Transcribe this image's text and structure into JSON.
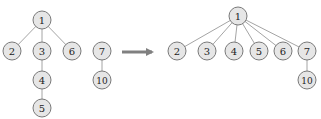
{
  "diagram": {
    "title": "",
    "colors": {
      "node_fill": "#e6e6e6",
      "node_stroke": "#7a7a7a",
      "edge": "#9a9a9a",
      "arrow": "#808080",
      "text": "#222222"
    },
    "node_radius": 9,
    "left": {
      "name": "before",
      "nodes": [
        {
          "id": "1",
          "label": "1",
          "x": 42,
          "y": 20
        },
        {
          "id": "2",
          "label": "2",
          "x": 12,
          "y": 51
        },
        {
          "id": "3",
          "label": "3",
          "x": 42,
          "y": 51
        },
        {
          "id": "6",
          "label": "6",
          "x": 72,
          "y": 51
        },
        {
          "id": "4",
          "label": "4",
          "x": 42,
          "y": 80
        },
        {
          "id": "5",
          "label": "5",
          "x": 42,
          "y": 108
        },
        {
          "id": "7",
          "label": "7",
          "x": 102,
          "y": 51
        },
        {
          "id": "10",
          "label": "10",
          "x": 102,
          "y": 80
        }
      ],
      "edges": [
        [
          "1",
          "2"
        ],
        [
          "1",
          "3"
        ],
        [
          "1",
          "6"
        ],
        [
          "3",
          "4"
        ],
        [
          "4",
          "5"
        ],
        [
          "7",
          "10"
        ]
      ]
    },
    "arrow": {
      "x1": 122,
      "y1": 52,
      "x2": 158,
      "y2": 52,
      "label": ""
    },
    "right": {
      "name": "after",
      "nodes": [
        {
          "id": "1",
          "label": "1",
          "x": 238,
          "y": 16
        },
        {
          "id": "2",
          "label": "2",
          "x": 177,
          "y": 51
        },
        {
          "id": "3",
          "label": "3",
          "x": 207,
          "y": 51
        },
        {
          "id": "4",
          "label": "4",
          "x": 234,
          "y": 51
        },
        {
          "id": "5",
          "label": "5",
          "x": 259,
          "y": 51
        },
        {
          "id": "6",
          "label": "6",
          "x": 283,
          "y": 51
        },
        {
          "id": "7",
          "label": "7",
          "x": 307,
          "y": 51
        },
        {
          "id": "10",
          "label": "10",
          "x": 307,
          "y": 80
        }
      ],
      "edges": [
        [
          "1",
          "2"
        ],
        [
          "1",
          "3"
        ],
        [
          "1",
          "4"
        ],
        [
          "1",
          "5"
        ],
        [
          "1",
          "6"
        ],
        [
          "1",
          "7"
        ],
        [
          "7",
          "10"
        ]
      ]
    }
  }
}
